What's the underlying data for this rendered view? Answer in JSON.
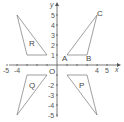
{
  "diagram": {
    "axes": {
      "x_label": "x",
      "y_label": "y",
      "origin_label": "O",
      "x_ticks": [
        "-5",
        "-4",
        "4",
        "5"
      ],
      "y_ticks": [
        "5",
        "4",
        "3",
        "2",
        "1",
        "-2",
        "-3",
        "-4",
        "-5"
      ],
      "range": [
        -5,
        5
      ]
    },
    "triangles": [
      {
        "name": "ABC",
        "label": "",
        "vertices": [
          [
            1,
            1
          ],
          [
            3,
            1
          ],
          [
            4,
            5
          ]
        ],
        "vertex_labels": [
          "A",
          "B",
          "C"
        ]
      },
      {
        "name": "R",
        "label": "R",
        "vertices": [
          [
            -1,
            1
          ],
          [
            -3,
            1
          ],
          [
            -4,
            5
          ]
        ]
      },
      {
        "name": "Q",
        "label": "Q",
        "vertices": [
          [
            -1,
            -1
          ],
          [
            -3,
            -1
          ],
          [
            -4,
            -5
          ]
        ]
      },
      {
        "name": "P",
        "label": "P",
        "vertices": [
          [
            1,
            -1
          ],
          [
            3,
            -1
          ],
          [
            4,
            -5
          ]
        ]
      }
    ],
    "colors": {
      "axis": "#555555",
      "triangle": "#777777",
      "text": "#444444"
    }
  }
}
